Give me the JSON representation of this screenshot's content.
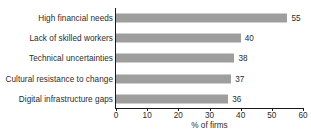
{
  "chart_data": {
    "type": "bar",
    "orientation": "horizontal",
    "title": "",
    "subtitle": "",
    "xlabel": "% of firms",
    "ylabel": "",
    "xlim": [
      0,
      60
    ],
    "xticks": [
      0,
      10,
      20,
      30,
      40,
      50,
      60
    ],
    "xtick_labels": [
      "0",
      "10",
      "20",
      "30",
      "40",
      "50",
      "60"
    ],
    "grid": false,
    "legend": null,
    "bar_color": "#9e9e9e",
    "axis_color": "#1a1a1a",
    "text_color": "#2b2b2b",
    "categories": [
      "High financial needs",
      "Lack of skilled workers",
      "Technical uncertainties",
      "Cultural resistance to change",
      "Digital infrastructure gaps"
    ],
    "values": [
      55,
      40,
      38,
      37,
      36
    ],
    "value_labels": [
      "55",
      "40",
      "38",
      "37",
      "36"
    ]
  }
}
